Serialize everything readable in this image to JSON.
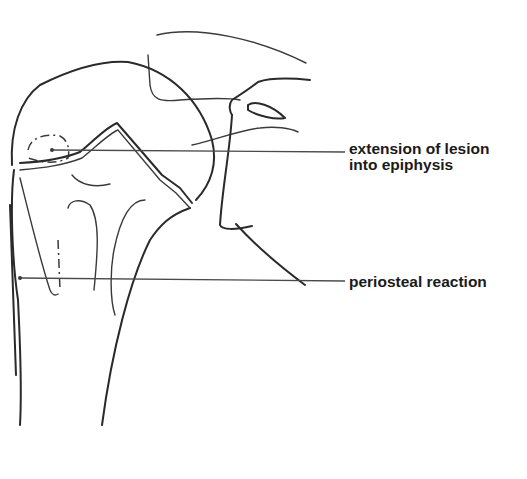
{
  "figure": {
    "type": "anatomical line drawing"
  },
  "annotations": [
    {
      "line1": "extension of lesion",
      "line2": "into epiphysis"
    },
    {
      "line1": "periosteal reaction"
    }
  ],
  "colors": {
    "stroke": "#2a2a2a",
    "background": "#ffffff"
  }
}
